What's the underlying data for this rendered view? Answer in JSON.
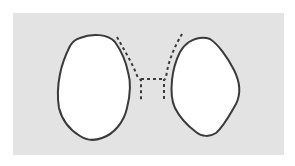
{
  "figure": {
    "background_color": "#ffffff",
    "panel_color": "#e3e3e3",
    "outline_color": "#3a3a3a",
    "lobe_fill": "#ffffff",
    "left_lobe": "solid outline lobe",
    "right_lobe": "solid outline lobe",
    "connector": "dashed outline"
  }
}
